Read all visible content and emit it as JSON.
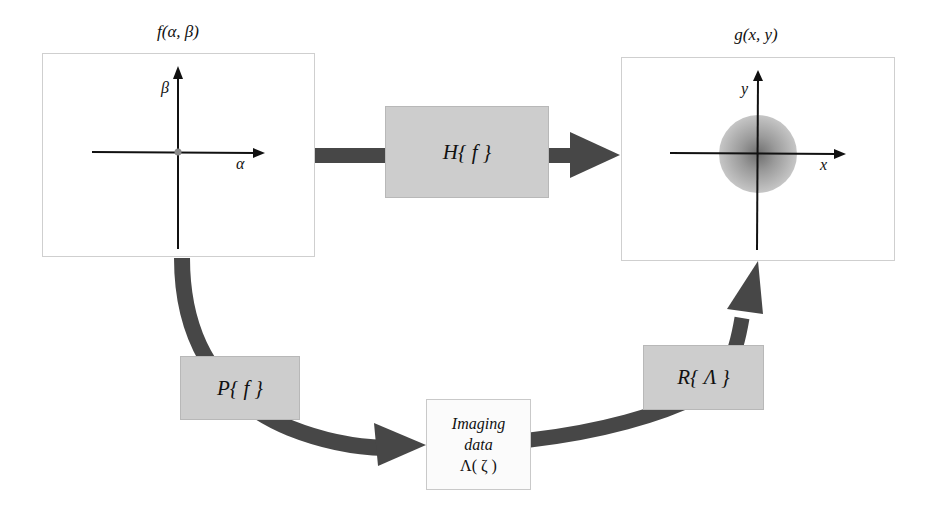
{
  "input_panel": {
    "title": "f(α, β)",
    "axis_x_label": "α",
    "axis_y_label": "β"
  },
  "output_panel": {
    "title": "g(x, y)",
    "axis_x_label": "x",
    "axis_y_label": "y"
  },
  "operators": {
    "forward": "H{ f }",
    "projection": "P{ f }",
    "reconstruction": "R{ Λ }"
  },
  "imaging_data": {
    "line1": "Imaging",
    "line2": "data",
    "line3": "Λ( ζ )"
  },
  "colors": {
    "arrow": "#474747",
    "operator_box": "#cdcdcd",
    "panel_border": "#cfcfcf",
    "blur_spot": "#8a8a8a"
  }
}
